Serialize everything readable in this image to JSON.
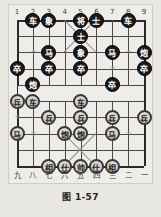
{
  "figure": {
    "caption": "图 1-57",
    "background_color": "#e9e7e2",
    "plate_color": "#efedea"
  },
  "board": {
    "type": "xiangqi-board",
    "files": 9,
    "ranks": 10,
    "line_color": "#4c4a47",
    "top_file_labels": [
      "1",
      "2",
      "3",
      "4",
      "5",
      "6",
      "7",
      "8",
      "9"
    ],
    "bottom_file_labels": [
      "九",
      "八",
      "七",
      "六",
      "五",
      "四",
      "三",
      "二",
      "一"
    ]
  },
  "pieces": [
    {
      "name": "black-chariot",
      "glyph": "车",
      "side": "black",
      "file": 2,
      "rank": 1
    },
    {
      "name": "black-elephant",
      "glyph": "象",
      "side": "black",
      "file": 3,
      "rank": 1
    },
    {
      "name": "black-general",
      "glyph": "将",
      "side": "black",
      "file": 5,
      "rank": 1
    },
    {
      "name": "black-advisor",
      "glyph": "士",
      "side": "black",
      "file": 6,
      "rank": 1
    },
    {
      "name": "black-chariot",
      "glyph": "车",
      "side": "black",
      "file": 8,
      "rank": 1
    },
    {
      "name": "black-advisor",
      "glyph": "士",
      "side": "black",
      "file": 5,
      "rank": 2
    },
    {
      "name": "black-horse",
      "glyph": "马",
      "side": "black",
      "file": 3,
      "rank": 3
    },
    {
      "name": "black-elephant",
      "glyph": "象",
      "side": "black",
      "file": 5,
      "rank": 3
    },
    {
      "name": "black-horse",
      "glyph": "马",
      "side": "black",
      "file": 7,
      "rank": 3
    },
    {
      "name": "black-cannon",
      "glyph": "炮",
      "side": "black",
      "file": 9,
      "rank": 3
    },
    {
      "name": "black-pawn",
      "glyph": "卒",
      "side": "black",
      "file": 1,
      "rank": 4
    },
    {
      "name": "black-pawn",
      "glyph": "卒",
      "side": "black",
      "file": 3,
      "rank": 4
    },
    {
      "name": "black-pawn",
      "glyph": "卒",
      "side": "black",
      "file": 5,
      "rank": 4
    },
    {
      "name": "black-pawn",
      "glyph": "卒",
      "side": "black",
      "file": 9,
      "rank": 4
    },
    {
      "name": "black-cannon",
      "glyph": "炮",
      "side": "black",
      "file": 2,
      "rank": 5
    },
    {
      "name": "black-pawn",
      "glyph": "卒",
      "side": "black",
      "file": 7,
      "rank": 5
    },
    {
      "name": "red-pawn",
      "glyph": "兵",
      "side": "red",
      "file": 1,
      "rank": 6
    },
    {
      "name": "red-chariot",
      "glyph": "车",
      "side": "red",
      "file": 2,
      "rank": 6
    },
    {
      "name": "red-chariot",
      "glyph": "车",
      "side": "red",
      "file": 5,
      "rank": 6
    },
    {
      "name": "red-pawn",
      "glyph": "兵",
      "side": "red",
      "file": 3,
      "rank": 7
    },
    {
      "name": "red-pawn",
      "glyph": "兵",
      "side": "red",
      "file": 5,
      "rank": 7
    },
    {
      "name": "red-pawn",
      "glyph": "兵",
      "side": "red",
      "file": 7,
      "rank": 7
    },
    {
      "name": "red-pawn",
      "glyph": "兵",
      "side": "red",
      "file": 9,
      "rank": 7
    },
    {
      "name": "red-horse",
      "glyph": "马",
      "side": "red",
      "file": 1,
      "rank": 8
    },
    {
      "name": "red-cannon",
      "glyph": "炮",
      "side": "red",
      "file": 4,
      "rank": 8
    },
    {
      "name": "red-cannon",
      "glyph": "炮",
      "side": "red",
      "file": 5,
      "rank": 8
    },
    {
      "name": "red-horse",
      "glyph": "马",
      "side": "red",
      "file": 7,
      "rank": 8
    },
    {
      "name": "red-elephant",
      "glyph": "相",
      "side": "red",
      "file": 3,
      "rank": 10
    },
    {
      "name": "red-advisor",
      "glyph": "仕",
      "side": "red",
      "file": 4,
      "rank": 10
    },
    {
      "name": "red-general",
      "glyph": "帅",
      "side": "red",
      "file": 5,
      "rank": 10
    },
    {
      "name": "red-advisor",
      "glyph": "仕",
      "side": "red",
      "file": 6,
      "rank": 10
    },
    {
      "name": "red-elephant",
      "glyph": "相",
      "side": "red",
      "file": 7,
      "rank": 10
    }
  ],
  "star_points": [
    {
      "file": 2,
      "rank": 3
    },
    {
      "file": 8,
      "rank": 3
    },
    {
      "file": 1,
      "rank": 4
    },
    {
      "file": 3,
      "rank": 4
    },
    {
      "file": 5,
      "rank": 4
    },
    {
      "file": 7,
      "rank": 4
    },
    {
      "file": 9,
      "rank": 4
    },
    {
      "file": 1,
      "rank": 7
    },
    {
      "file": 3,
      "rank": 7
    },
    {
      "file": 5,
      "rank": 7
    },
    {
      "file": 7,
      "rank": 7
    },
    {
      "file": 9,
      "rank": 7
    },
    {
      "file": 2,
      "rank": 8
    },
    {
      "file": 8,
      "rank": 8
    }
  ]
}
